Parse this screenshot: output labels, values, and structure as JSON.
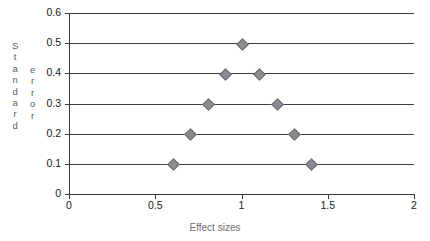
{
  "chart_data": {
    "type": "scatter",
    "title": "",
    "xlabel": "Effect sizes",
    "ylabel": "Standard error",
    "xlim": [
      0,
      2
    ],
    "ylim": [
      0,
      0.6
    ],
    "grid": true,
    "legend": "none",
    "x_ticks": [
      "0",
      "0.5",
      "1",
      "1.5",
      "2"
    ],
    "x_tick_values": [
      0,
      0.5,
      1,
      1.5,
      2
    ],
    "y_ticks": [
      "0.6",
      "0.5",
      "0.4",
      "0.3",
      "0.2",
      "0.1",
      "0"
    ],
    "y_tick_values": [
      0.6,
      0.5,
      0.4,
      0.3,
      0.2,
      0.1,
      0
    ],
    "marker_color": "#8a8a92",
    "marker_shape": "diamond",
    "gridline_color": "#3f3f3f",
    "axis_color": "#3a3a3a",
    "points": [
      {
        "x": 1.0,
        "y": 0.5
      },
      {
        "x": 0.9,
        "y": 0.4
      },
      {
        "x": 1.1,
        "y": 0.4
      },
      {
        "x": 0.8,
        "y": 0.3
      },
      {
        "x": 1.2,
        "y": 0.3
      },
      {
        "x": 0.7,
        "y": 0.2
      },
      {
        "x": 1.3,
        "y": 0.2
      },
      {
        "x": 0.6,
        "y": 0.1
      },
      {
        "x": 1.4,
        "y": 0.1
      }
    ],
    "ylabel_chars_column_a": [
      "S",
      "t",
      "a",
      "n",
      "d",
      "a",
      "r",
      "d"
    ],
    "ylabel_chars_column_b": [
      "e",
      "r",
      "r",
      "o",
      "r"
    ]
  }
}
